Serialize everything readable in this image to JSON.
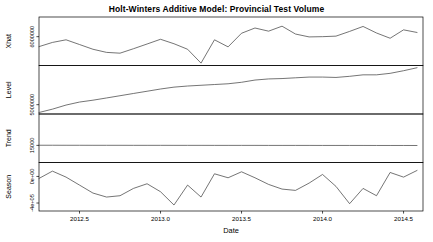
{
  "title": "Holt-Winters Additive Model: Provincial Test Volume",
  "axes": {
    "x_title": "Date",
    "x_ticks": [
      "2012.5",
      "2013.0",
      "2013.5",
      "2014.0",
      "2014.5"
    ]
  },
  "panels": [
    {
      "name": "xhat",
      "y_title": "Xhat",
      "y_ticks": [
        "6000000"
      ]
    },
    {
      "name": "level",
      "y_title": "Level",
      "y_ticks": [
        "5000000"
      ]
    },
    {
      "name": "trend",
      "y_title": "Trend",
      "y_ticks": [
        "15000"
      ]
    },
    {
      "name": "season",
      "y_title": "Season",
      "y_ticks": [
        "-4e+05",
        "0e+00"
      ]
    }
  ],
  "colors": {
    "line": "#3a3a3a",
    "frame": "#000000",
    "background": "#ffffff"
  },
  "chart_data": {
    "type": "line",
    "title": "Holt-Winters Additive Model: Provincial Test Volume",
    "xlabel": "Date",
    "ylabel": "",
    "xlim": [
      2012.25,
      2014.62
    ],
    "grid": false,
    "legend": null,
    "layout": "4 stacked panels sharing one x-axis (R plot.HoltWinters decomposition)",
    "x": [
      2012.25,
      2012.333,
      2012.417,
      2012.5,
      2012.583,
      2012.667,
      2012.75,
      2012.833,
      2012.917,
      2013.0,
      2013.083,
      2013.167,
      2013.25,
      2013.333,
      2013.417,
      2013.5,
      2013.583,
      2013.667,
      2013.75,
      2013.833,
      2013.917,
      2014.0,
      2014.083,
      2014.167,
      2014.25,
      2014.333,
      2014.417,
      2014.5,
      2014.583
    ],
    "series": [
      {
        "name": "Xhat",
        "panel": "xhat",
        "ylim": [
          4900000,
          6750000
        ],
        "ytick_values": [
          6000000
        ],
        "ytick_labels": [
          "6000000"
        ],
        "values": [
          5620000,
          5780000,
          5880000,
          5700000,
          5520000,
          5400000,
          5370000,
          5540000,
          5720000,
          5900000,
          5730000,
          5520000,
          4990000,
          5880000,
          5610000,
          6130000,
          6330000,
          6210000,
          6400000,
          6100000,
          5990000,
          6000000,
          6020000,
          6200000,
          6390000,
          6140000,
          5940000,
          6260000,
          6160000
        ]
      },
      {
        "name": "Level",
        "panel": "level",
        "ylim": [
          4750000,
          6050000
        ],
        "ytick_values": [
          5000000
        ],
        "ytick_labels": [
          "5000000"
        ],
        "values": [
          4790000,
          4880000,
          4990000,
          5070000,
          5120000,
          5180000,
          5240000,
          5300000,
          5360000,
          5420000,
          5470000,
          5500000,
          5520000,
          5540000,
          5560000,
          5600000,
          5660000,
          5690000,
          5700000,
          5720000,
          5740000,
          5740000,
          5730000,
          5760000,
          5800000,
          5800000,
          5840000,
          5910000,
          5990000
        ]
      },
      {
        "name": "Trend",
        "panel": "trend",
        "ylim": [
          9000,
          26000
        ],
        "ytick_values": [
          15000
        ],
        "ytick_labels": [
          "15000"
        ],
        "values": [
          15050,
          15050,
          15040,
          15040,
          15030,
          15030,
          15030,
          15020,
          15020,
          15020,
          15010,
          15010,
          15010,
          15000,
          15000,
          15000,
          15000,
          14990,
          14990,
          14990,
          14990,
          14980,
          14980,
          14980,
          14980,
          14970,
          14970,
          14970,
          14960
        ]
      },
      {
        "name": "Season",
        "panel": "season",
        "ylim": [
          -520000,
          210000
        ],
        "ytick_values": [
          -400000,
          0
        ],
        "ytick_labels": [
          "-4e+05",
          "0e+00"
        ],
        "values": [
          -30000,
          80000,
          -10000,
          -130000,
          -250000,
          -310000,
          -290000,
          -180000,
          -110000,
          -230000,
          -430000,
          -130000,
          -310000,
          40000,
          -20000,
          70000,
          -20000,
          -120000,
          -190000,
          -210000,
          -100000,
          30000,
          -150000,
          -410000,
          -180000,
          -290000,
          60000,
          -10000,
          90000
        ]
      }
    ]
  }
}
